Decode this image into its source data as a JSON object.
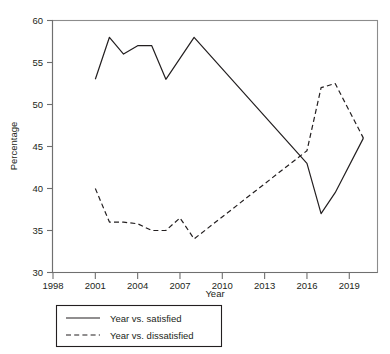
{
  "chart_data": {
    "type": "line",
    "title": "",
    "xlabel": "Year",
    "ylabel": "Percentage",
    "xlim": [
      1998,
      2021
    ],
    "ylim": [
      30,
      60
    ],
    "xticks": [
      1998,
      2001,
      2004,
      2007,
      2010,
      2013,
      2016,
      2019
    ],
    "yticks": [
      30,
      35,
      40,
      45,
      50,
      55,
      60
    ],
    "grid": false,
    "legend_position": "below-axes",
    "series": [
      {
        "name": "Year vs. satisfied",
        "style": "solid",
        "color": "#231f20",
        "x": [
          2001,
          2002,
          2003,
          2004,
          2005,
          2006,
          2007,
          2008,
          2016,
          2017,
          2018,
          2020
        ],
        "values": [
          53,
          58,
          56,
          57,
          57,
          53,
          55.5,
          58,
          43,
          37,
          39.5,
          46
        ]
      },
      {
        "name": "Year vs. dissatisfied",
        "style": "dashed",
        "color": "#231f20",
        "x": [
          2001,
          2002,
          2003,
          2004,
          2005,
          2006,
          2007,
          2008,
          2016,
          2017,
          2018,
          2020
        ],
        "values": [
          40,
          36,
          36,
          35.8,
          35,
          35,
          36.5,
          34,
          44.5,
          52,
          52.5,
          46
        ]
      }
    ]
  },
  "axes": {
    "y_tick_labels": [
      "60",
      "55",
      "50",
      "45",
      "40",
      "35",
      "30"
    ],
    "x_tick_labels": [
      "1998",
      "2001",
      "2004",
      "2007",
      "2010",
      "2013",
      "2016",
      "2019"
    ],
    "x_axis_title": "Year",
    "y_axis_title": "Percentage"
  },
  "legend": {
    "items": [
      {
        "label": "Year vs. satisfied",
        "style": "solid"
      },
      {
        "label": "Year vs. dissatisfied",
        "style": "dashed"
      }
    ]
  },
  "colors": {
    "ink": "#231f20",
    "frame": "#8c8c8c",
    "background": "#ffffff"
  }
}
